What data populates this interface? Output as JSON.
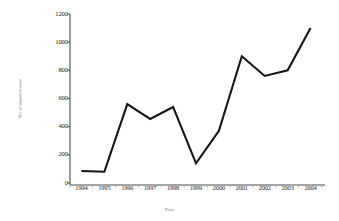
{
  "chart_data": {
    "type": "line",
    "title": "",
    "xlabel": "Year",
    "ylabel": "No. of imported cases",
    "categories": [
      "1994",
      "1995",
      "1996",
      "1997",
      "1998",
      "1999",
      "2000",
      "2001",
      "2002",
      "2003",
      "2004"
    ],
    "values": [
      85,
      80,
      560,
      455,
      540,
      140,
      370,
      900,
      760,
      800,
      1100
    ],
    "series": [
      {
        "name": "Imported cases",
        "values": [
          85,
          80,
          560,
          455,
          540,
          140,
          370,
          900,
          760,
          800,
          1100
        ]
      }
    ],
    "ylim": [
      0,
      1200
    ],
    "ytick_labels": [
      "0",
      "200",
      "400",
      "600",
      "800",
      "1000",
      "1200"
    ],
    "ytick_values": [
      0,
      200,
      400,
      600,
      800,
      1000,
      1200
    ],
    "grid": false,
    "legend": false,
    "legend_position": "none",
    "line_color": "#151515",
    "line_width": 2.1,
    "markers": false,
    "axis_color": "#4d4d4d",
    "background_color": "#ffffff"
  },
  "axes": {
    "y_label": "No. of imported cases",
    "x_label": "Year"
  }
}
